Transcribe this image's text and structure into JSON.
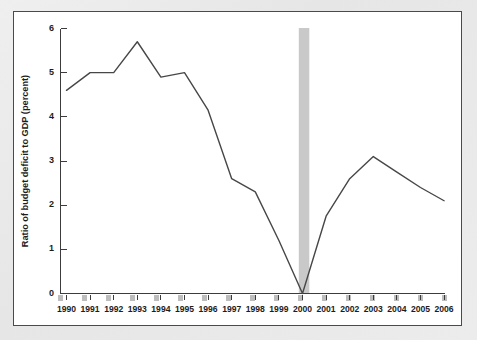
{
  "figure": {
    "panel_background": "#ffffff",
    "outer_background": "#ececec",
    "frame_color": "#4a4a4a"
  },
  "chart_data": {
    "type": "line",
    "title": "",
    "subtitle": "",
    "xlabel": "",
    "ylabel": "Ratio of budget deficit to GDP (percent)",
    "x": [
      1990,
      1991,
      1992,
      1993,
      1994,
      1995,
      1996,
      1997,
      1998,
      1999,
      2000,
      2001,
      2002,
      2003,
      2004,
      2005,
      2006
    ],
    "categories": [
      "1990",
      "1991",
      "1992",
      "1993",
      "1994",
      "1995",
      "1996",
      "1997",
      "1998",
      "1999",
      "2000",
      "2001",
      "2002",
      "2003",
      "2004",
      "2005",
      "2006"
    ],
    "values": [
      4.6,
      5.0,
      5.0,
      5.7,
      4.9,
      5.0,
      4.15,
      2.6,
      2.3,
      1.2,
      0.0,
      1.75,
      2.6,
      3.1,
      2.75,
      2.4,
      2.1
    ],
    "series": [
      {
        "name": "Ratio of budget deficit to GDP",
        "color": "#474747",
        "values": [
          4.6,
          5.0,
          5.0,
          5.7,
          4.9,
          5.0,
          4.15,
          2.6,
          2.3,
          1.2,
          0.0,
          1.75,
          2.6,
          3.1,
          2.75,
          2.4,
          2.1
        ]
      }
    ],
    "xlim": [
      1990,
      2006
    ],
    "ylim": [
      0,
      6
    ],
    "ytick_labels": [
      "0",
      "1",
      "2",
      "3",
      "4",
      "5",
      "6"
    ],
    "ytick_values": [
      0,
      1,
      2,
      3,
      4,
      5,
      6
    ],
    "xtick_labels": [
      "1990",
      "1991",
      "1992",
      "1993",
      "1994",
      "1995",
      "1996",
      "1997",
      "1998",
      "1999",
      "2000",
      "2001",
      "2002",
      "2003",
      "2004",
      "2005",
      "2006"
    ],
    "grid": false,
    "legend": "none",
    "annotations": [
      {
        "type": "vertical-band",
        "name": "year-2000-highlight",
        "x_center": 2000,
        "color": "#c9c9c9",
        "label": ""
      }
    ]
  }
}
